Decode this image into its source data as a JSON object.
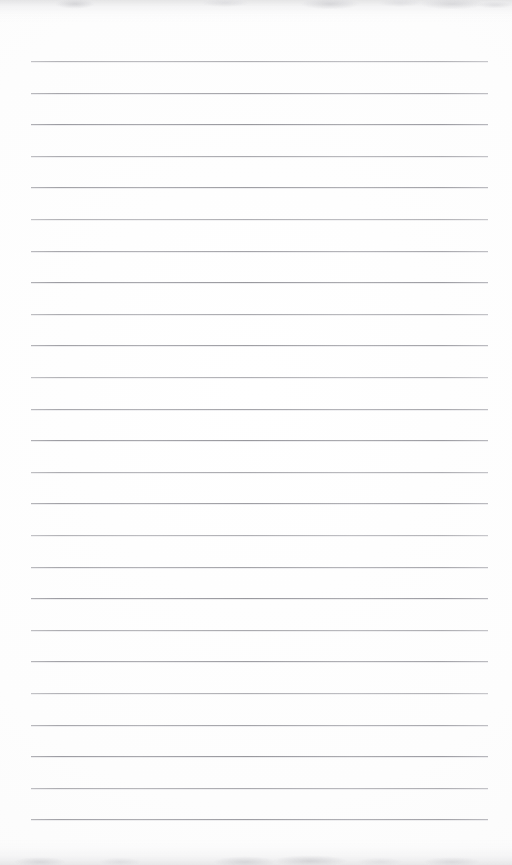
{
  "document": {
    "kind": "scanned-lined-notepad-page",
    "title": "Blank lined notepad page",
    "page_width": 512,
    "page_height": 865,
    "background_color": "#fdfdfd",
    "has_text_content": false,
    "body_text": "",
    "header_text": "",
    "footer_text": "",
    "page_number": ""
  },
  "ruling": {
    "line_color": "#adadb2",
    "line_thickness": 1,
    "line_count": 25,
    "line_left": 31,
    "line_right": 488,
    "line_width": 457,
    "first_line_y": 61,
    "line_spacing": 31.6,
    "margin_left": 31,
    "margin_right": 24,
    "margin_top": 61,
    "margin_bottom": 47,
    "line_y_positions": [
      61,
      92.6,
      124.2,
      155.8,
      187.4,
      219,
      250.6,
      282.2,
      313.8,
      345.4,
      377,
      408.6,
      440.2,
      471.8,
      503.4,
      535,
      566.6,
      598.2,
      629.8,
      661.4,
      693,
      724.6,
      756.2,
      787.8,
      819.4
    ]
  },
  "scan_artifacts": {
    "top_smudge_color": "#c4c4c8",
    "bottom_smudge_color": "#c6c6ca",
    "top_smudge_height": 22,
    "bottom_smudge_height": 26
  }
}
